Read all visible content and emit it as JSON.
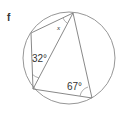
{
  "figure": {
    "part_label": "f",
    "angles": {
      "unknown": "x",
      "left": "32°",
      "bottom_right": "67°"
    },
    "colors": {
      "stroke": "#8a8a8a",
      "text": "#333333"
    }
  }
}
